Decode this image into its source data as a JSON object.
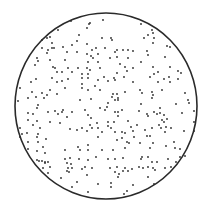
{
  "diagram": {
    "type": "random-point-pattern-in-circle",
    "colors": {
      "background": "#ffffff",
      "boundary": "#2a2a2a",
      "dot": "#2b2b2b"
    },
    "circle": {
      "cx": 106,
      "cy": 106,
      "rx": 91,
      "ry": 93
    },
    "dot_radius": 0.9,
    "dots": [
      [
        58,
        30
      ],
      [
        50,
        37
      ],
      [
        47,
        38
      ],
      [
        42,
        40
      ],
      [
        52,
        43
      ],
      [
        63,
        47
      ],
      [
        72,
        45
      ],
      [
        42,
        48
      ],
      [
        48,
        50
      ],
      [
        52,
        48
      ],
      [
        54,
        48
      ],
      [
        47,
        53
      ],
      [
        67,
        52
      ],
      [
        37,
        58
      ],
      [
        38,
        61
      ],
      [
        50,
        60
      ],
      [
        65,
        60
      ],
      [
        35,
        65
      ],
      [
        53,
        67
      ],
      [
        55,
        68
      ],
      [
        68,
        68
      ],
      [
        57,
        72
      ],
      [
        62,
        72
      ],
      [
        72,
        72
      ],
      [
        103,
        20
      ],
      [
        89,
        24
      ],
      [
        71,
        21
      ],
      [
        90,
        23
      ],
      [
        87,
        28
      ],
      [
        79,
        35
      ],
      [
        102,
        38
      ],
      [
        111,
        38
      ],
      [
        112,
        40
      ],
      [
        77,
        41
      ],
      [
        87,
        44
      ],
      [
        96,
        48
      ],
      [
        105,
        48
      ],
      [
        92,
        50
      ],
      [
        115,
        52
      ],
      [
        117,
        50
      ],
      [
        123,
        50
      ],
      [
        128,
        50
      ],
      [
        133,
        51
      ],
      [
        77,
        52
      ],
      [
        87,
        54
      ],
      [
        91,
        56
      ],
      [
        93,
        58
      ],
      [
        98,
        54
      ],
      [
        110,
        58
      ],
      [
        117,
        57
      ],
      [
        128,
        58
      ],
      [
        88,
        62
      ],
      [
        98,
        62
      ],
      [
        120,
        64
      ],
      [
        78,
        68
      ],
      [
        87,
        68
      ],
      [
        90,
        70
      ],
      [
        100,
        68
      ],
      [
        125,
        67
      ],
      [
        127,
        71
      ],
      [
        133,
        68
      ],
      [
        82,
        74
      ],
      [
        88,
        74
      ],
      [
        117,
        73
      ],
      [
        141,
        24
      ],
      [
        152,
        30
      ],
      [
        153,
        33
      ],
      [
        148,
        35
      ],
      [
        144,
        38
      ],
      [
        154,
        38
      ],
      [
        153,
        43
      ],
      [
        167,
        46
      ],
      [
        170,
        47
      ],
      [
        147,
        51
      ],
      [
        148,
        55
      ],
      [
        165,
        57
      ],
      [
        141,
        62
      ],
      [
        153,
        67
      ],
      [
        170,
        67
      ],
      [
        158,
        72
      ],
      [
        154,
        74
      ],
      [
        178,
        71
      ],
      [
        181,
        73
      ],
      [
        20,
        88
      ],
      [
        31,
        82
      ],
      [
        36,
        79
      ],
      [
        52,
        78
      ],
      [
        57,
        82
      ],
      [
        62,
        81
      ],
      [
        68,
        79
      ],
      [
        50,
        90
      ],
      [
        32,
        92
      ],
      [
        42,
        93
      ],
      [
        47,
        95
      ],
      [
        57,
        94
      ],
      [
        65,
        88
      ],
      [
        28,
        98
      ],
      [
        36,
        97
      ],
      [
        44,
        98
      ],
      [
        18,
        101
      ],
      [
        38,
        105
      ],
      [
        37,
        108
      ],
      [
        28,
        113
      ],
      [
        33,
        114
      ],
      [
        48,
        112
      ],
      [
        55,
        111
      ],
      [
        58,
        114
      ],
      [
        62,
        112
      ],
      [
        63,
        110
      ],
      [
        67,
        117
      ],
      [
        72,
        112
      ],
      [
        28,
        120
      ],
      [
        37,
        121
      ],
      [
        50,
        122
      ],
      [
        60,
        123
      ],
      [
        33,
        125
      ],
      [
        40,
        128
      ],
      [
        20,
        128
      ],
      [
        70,
        129
      ],
      [
        22,
        134
      ],
      [
        27,
        133
      ],
      [
        38,
        134
      ],
      [
        82,
        78
      ],
      [
        88,
        78
      ],
      [
        98,
        80
      ],
      [
        104,
        77
      ],
      [
        114,
        78
      ],
      [
        115,
        80
      ],
      [
        124,
        77
      ],
      [
        108,
        81
      ],
      [
        133,
        82
      ],
      [
        82,
        84
      ],
      [
        82,
        88
      ],
      [
        88,
        90
      ],
      [
        95,
        86
      ],
      [
        100,
        90
      ],
      [
        113,
        94
      ],
      [
        117,
        94
      ],
      [
        125,
        92
      ],
      [
        112,
        97
      ],
      [
        118,
        98
      ],
      [
        80,
        100
      ],
      [
        91,
        99
      ],
      [
        115,
        100
      ],
      [
        118,
        100
      ],
      [
        108,
        103
      ],
      [
        107,
        107
      ],
      [
        100,
        108
      ],
      [
        105,
        110
      ],
      [
        85,
        110
      ],
      [
        115,
        112
      ],
      [
        118,
        112
      ],
      [
        122,
        110
      ],
      [
        88,
        115
      ],
      [
        91,
        118
      ],
      [
        118,
        116
      ],
      [
        114,
        122
      ],
      [
        97,
        123
      ],
      [
        108,
        122
      ],
      [
        108,
        126
      ],
      [
        90,
        125
      ],
      [
        82,
        128
      ],
      [
        92,
        128
      ],
      [
        98,
        128
      ],
      [
        111,
        128
      ],
      [
        128,
        121
      ],
      [
        131,
        127
      ],
      [
        77,
        130
      ],
      [
        87,
        131
      ],
      [
        102,
        132
      ],
      [
        115,
        132
      ],
      [
        122,
        132
      ],
      [
        125,
        133
      ],
      [
        133,
        131
      ],
      [
        134,
        137
      ],
      [
        150,
        77
      ],
      [
        158,
        82
      ],
      [
        164,
        79
      ],
      [
        169,
        77
      ],
      [
        170,
        82
      ],
      [
        178,
        79
      ],
      [
        140,
        90
      ],
      [
        142,
        93
      ],
      [
        152,
        92
      ],
      [
        153,
        95
      ],
      [
        152,
        98
      ],
      [
        162,
        90
      ],
      [
        185,
        93
      ],
      [
        188,
        100
      ],
      [
        189,
        103
      ],
      [
        176,
        104
      ],
      [
        141,
        104
      ],
      [
        139,
        111
      ],
      [
        160,
        108
      ],
      [
        194,
        111
      ],
      [
        154,
        112
      ],
      [
        148,
        116
      ],
      [
        157,
        114
      ],
      [
        160,
        113
      ],
      [
        164,
        115
      ],
      [
        147,
        114
      ],
      [
        162,
        120
      ],
      [
        164,
        122
      ],
      [
        167,
        119
      ],
      [
        182,
        113
      ],
      [
        137,
        125
      ],
      [
        152,
        128
      ],
      [
        159,
        125
      ],
      [
        161,
        128
      ],
      [
        166,
        127
      ],
      [
        171,
        128
      ],
      [
        194,
        122
      ],
      [
        145,
        130
      ],
      [
        165,
        132
      ],
      [
        184,
        131
      ],
      [
        194,
        131
      ],
      [
        20,
        137
      ],
      [
        37,
        137
      ],
      [
        46,
        139
      ],
      [
        28,
        142
      ],
      [
        38,
        142
      ],
      [
        43,
        147
      ],
      [
        28,
        149
      ],
      [
        37,
        151
      ],
      [
        45,
        153
      ],
      [
        65,
        150
      ],
      [
        70,
        158
      ],
      [
        65,
        159
      ],
      [
        67,
        163
      ],
      [
        71,
        164
      ],
      [
        37,
        160
      ],
      [
        39,
        161
      ],
      [
        42,
        161
      ],
      [
        45,
        162
      ],
      [
        48,
        162
      ],
      [
        50,
        167
      ],
      [
        43,
        168
      ],
      [
        48,
        173
      ],
      [
        68,
        168
      ],
      [
        72,
        168
      ],
      [
        67,
        171
      ],
      [
        69,
        172
      ],
      [
        61,
        178
      ],
      [
        72,
        187
      ],
      [
        45,
        163
      ],
      [
        98,
        137
      ],
      [
        117,
        140
      ],
      [
        122,
        138
      ],
      [
        127,
        142
      ],
      [
        129,
        143
      ],
      [
        78,
        147
      ],
      [
        88,
        145
      ],
      [
        80,
        150
      ],
      [
        88,
        150
      ],
      [
        102,
        150
      ],
      [
        113,
        150
      ],
      [
        125,
        148
      ],
      [
        96,
        157
      ],
      [
        79,
        159
      ],
      [
        88,
        160
      ],
      [
        108,
        159
      ],
      [
        115,
        159
      ],
      [
        123,
        158
      ],
      [
        85,
        167
      ],
      [
        92,
        168
      ],
      [
        82,
        169
      ],
      [
        110,
        168
      ],
      [
        117,
        167
      ],
      [
        125,
        168
      ],
      [
        115,
        172
      ],
      [
        119,
        174
      ],
      [
        118,
        177
      ],
      [
        123,
        171
      ],
      [
        128,
        171
      ],
      [
        132,
        169
      ],
      [
        87,
        175
      ],
      [
        77,
        182
      ],
      [
        98,
        184
      ],
      [
        111,
        183
      ],
      [
        111,
        187
      ],
      [
        133,
        185
      ],
      [
        127,
        191
      ],
      [
        88,
        192
      ],
      [
        124,
        194
      ],
      [
        147,
        136
      ],
      [
        150,
        136
      ],
      [
        140,
        143
      ],
      [
        153,
        143
      ],
      [
        174,
        142
      ],
      [
        166,
        146
      ],
      [
        150,
        148
      ],
      [
        175,
        148
      ],
      [
        180,
        149
      ],
      [
        142,
        157
      ],
      [
        141,
        159
      ],
      [
        148,
        157
      ],
      [
        168,
        159
      ],
      [
        180,
        157
      ],
      [
        185,
        156
      ],
      [
        152,
        162
      ],
      [
        157,
        162
      ],
      [
        176,
        162
      ],
      [
        139,
        167
      ],
      [
        143,
        168
      ],
      [
        148,
        167
      ],
      [
        153,
        168
      ],
      [
        155,
        170
      ],
      [
        165,
        168
      ],
      [
        171,
        167
      ],
      [
        148,
        177
      ],
      [
        154,
        184
      ]
    ]
  }
}
